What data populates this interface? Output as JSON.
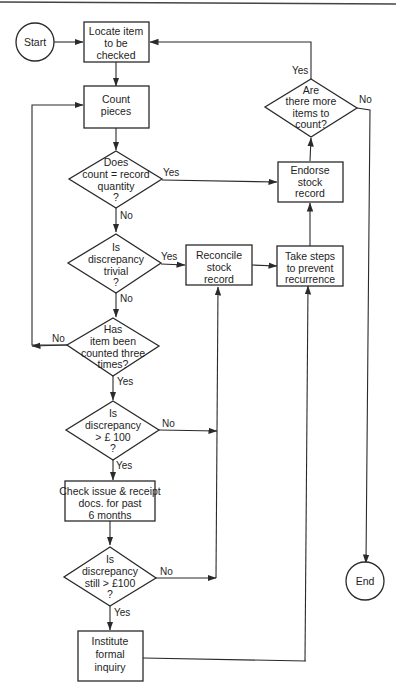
{
  "diagram": {
    "type": "flowchart",
    "terminals": {
      "start": "Start",
      "end": "End"
    },
    "processes": {
      "locate": [
        "Locate item",
        "to be",
        "checked"
      ],
      "count": [
        "Count",
        "pieces"
      ],
      "endorse": [
        "Endorse",
        "stock",
        "record"
      ],
      "reconcile": [
        "Reconcile",
        "stock",
        "record"
      ],
      "prevent": [
        "Take steps",
        "to prevent",
        "recurrence"
      ],
      "check_docs": [
        "Check issue & receipt",
        "docs. for past",
        "6 months"
      ],
      "inquiry": [
        "Institute",
        "formal",
        "inquiry"
      ]
    },
    "decisions": {
      "count_match": [
        "Does",
        "count = record",
        "quantity",
        "?"
      ],
      "trivial": [
        "Is",
        "discrepancy",
        "trivial",
        "?"
      ],
      "three_times": [
        "Has",
        "item been",
        "counted three",
        "times?"
      ],
      "over_100": [
        "Is",
        "discrepancy",
        "> £ 100",
        "?"
      ],
      "still_over_100": [
        "Is",
        "discrepancy",
        "still > £100",
        "?"
      ],
      "more_items": [
        "Are",
        "there more",
        "items to",
        "count?"
      ]
    },
    "edge_labels": {
      "yes": "Yes",
      "no": "No"
    },
    "edges": [
      {
        "from": "Start",
        "to": "Locate item to be checked",
        "label": ""
      },
      {
        "from": "Locate item to be checked",
        "to": "Count pieces",
        "label": ""
      },
      {
        "from": "Count pieces",
        "to": "Does count = record quantity?",
        "label": ""
      },
      {
        "from": "Does count = record quantity?",
        "to": "Endorse stock record",
        "label": "Yes"
      },
      {
        "from": "Does count = record quantity?",
        "to": "Is discrepancy trivial?",
        "label": "No"
      },
      {
        "from": "Is discrepancy trivial?",
        "to": "Reconcile stock record",
        "label": "Yes"
      },
      {
        "from": "Is discrepancy trivial?",
        "to": "Has item been counted three times?",
        "label": "No"
      },
      {
        "from": "Has item been counted three times?",
        "to": "Count pieces",
        "label": "No"
      },
      {
        "from": "Has item been counted three times?",
        "to": "Is discrepancy > £ 100?",
        "label": "Yes"
      },
      {
        "from": "Is discrepancy > £ 100?",
        "to": "Reconcile stock record",
        "label": "No"
      },
      {
        "from": "Is discrepancy > £ 100?",
        "to": "Check issue & receipt docs. for past 6 months",
        "label": "Yes"
      },
      {
        "from": "Check issue & receipt docs. for past 6 months",
        "to": "Is discrepancy still > £100?",
        "label": ""
      },
      {
        "from": "Is discrepancy still > £100?",
        "to": "Reconcile stock record",
        "label": "No"
      },
      {
        "from": "Is discrepancy still > £100?",
        "to": "Institute formal inquiry",
        "label": "Yes"
      },
      {
        "from": "Institute formal inquiry",
        "to": "Take steps to prevent recurrence",
        "label": ""
      },
      {
        "from": "Reconcile stock record",
        "to": "Take steps to prevent recurrence",
        "label": ""
      },
      {
        "from": "Take steps to prevent recurrence",
        "to": "Endorse stock record",
        "label": ""
      },
      {
        "from": "Endorse stock record",
        "to": "Are there more items to count?",
        "label": ""
      },
      {
        "from": "Are there more items to count?",
        "to": "Locate item to be checked",
        "label": "Yes"
      },
      {
        "from": "Are there more items to count?",
        "to": "End",
        "label": "No"
      }
    ]
  }
}
